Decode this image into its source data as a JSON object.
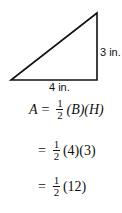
{
  "figure": {
    "type": "right-triangle",
    "height_label": "3 in.",
    "base_label": "4 in."
  },
  "equations": [
    {
      "lhs": "A",
      "eq": "=",
      "num": "1",
      "den": "2",
      "rhs": "(B)(H)"
    },
    {
      "lhs": "",
      "eq": "=",
      "num": "1",
      "den": "2",
      "rhs": "(4)(3)"
    },
    {
      "lhs": "",
      "eq": "=",
      "num": "1",
      "den": "2",
      "rhs": "(12)"
    }
  ]
}
